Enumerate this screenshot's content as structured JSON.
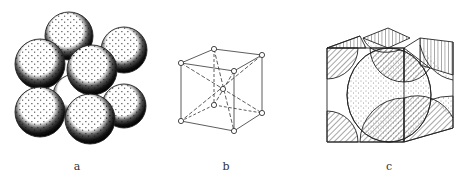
{
  "figure": {
    "panels": [
      {
        "id": "a",
        "label": "a",
        "description": "hard-sphere packing model"
      },
      {
        "id": "b",
        "label": "b",
        "description": "lattice-point wireframe unit cell"
      },
      {
        "id": "c",
        "label": "c",
        "description": "unit cell with sectioned atoms"
      }
    ],
    "colors": {
      "stroke": "#222222",
      "shade": "#111111",
      "background": "#ffffff"
    }
  }
}
